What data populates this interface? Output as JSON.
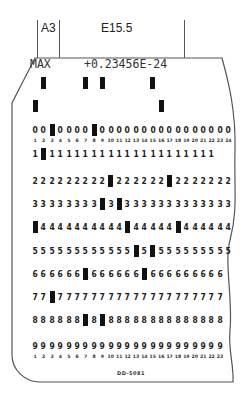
{
  "header": {
    "field_a": "A3",
    "field_b": "E15.5"
  },
  "card": {
    "title_left": "MAX",
    "title_value": "+0.23456E-24",
    "form_number": "DD-5081",
    "top_column_numbers": [
      "1",
      "2",
      "3",
      "4",
      "5",
      "6",
      "7",
      "8",
      "9",
      "10",
      "11",
      "12",
      "13",
      "14",
      "15",
      "16",
      "17",
      "18",
      "19",
      "20",
      "21",
      "22",
      "23",
      "24"
    ],
    "bottom_column_numbers": [
      "1",
      "2",
      "3",
      "4",
      "5",
      "6",
      "7",
      "8",
      "9",
      "10",
      "11",
      "12",
      "13",
      "14",
      "15",
      "16",
      "17",
      "18",
      "19",
      "20",
      "21",
      "22",
      "23"
    ],
    "zone_punches": {
      "row12": [
        2,
        7,
        9,
        15
      ],
      "row11": [
        1,
        16
      ]
    },
    "rows": [
      {
        "digit": "0",
        "columns": 24,
        "punched": [
          3,
          8
        ]
      },
      {
        "digit": "1",
        "columns": 22,
        "punched": [
          2
        ]
      },
      {
        "digit": "2",
        "columns": 24,
        "punched": [
          10,
          17
        ]
      },
      {
        "digit": "3",
        "columns": 24,
        "punched": [
          9,
          11
        ]
      },
      {
        "digit": "4",
        "columns": 24,
        "punched": [
          1,
          12,
          18
        ]
      },
      {
        "digit": "5",
        "columns": 24,
        "punched": [
          13,
          15
        ]
      },
      {
        "digit": "6",
        "columns": 23,
        "punched": [
          7,
          14
        ]
      },
      {
        "digit": "7",
        "columns": 23,
        "punched": [
          3
        ]
      },
      {
        "digit": "8",
        "columns": 23,
        "punched": [
          7,
          9
        ]
      },
      {
        "digit": "9",
        "columns": 23,
        "punched": []
      }
    ]
  }
}
